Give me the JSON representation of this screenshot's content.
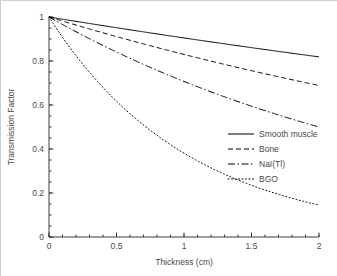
{
  "chart_data": {
    "type": "line",
    "title": "",
    "subtitle": "",
    "xlabel": "Thickness (cm)",
    "ylabel": "Transmission Factor",
    "xlim": [
      0,
      2
    ],
    "ylim": [
      0,
      1
    ],
    "grid": false,
    "legend_position": "center-right",
    "xticks": [
      0,
      0.5,
      1,
      1.5,
      2
    ],
    "xticklabels": [
      "0",
      "0.5",
      "1",
      "1.5",
      "2"
    ],
    "xminor_step": 0.1,
    "yticks": [
      0,
      0.2,
      0.4,
      0.6,
      0.8,
      1
    ],
    "yticklabels": [
      "0",
      "0.2",
      "0.4",
      "0.6",
      "0.8",
      "1"
    ],
    "yminor_step": 0.05,
    "x": [
      0,
      0.1,
      0.2,
      0.3,
      0.4,
      0.5,
      0.6,
      0.7,
      0.8,
      0.9,
      1.0,
      1.1,
      1.2,
      1.3,
      1.4,
      1.5,
      1.6,
      1.7,
      1.8,
      1.9,
      2.0
    ],
    "series": [
      {
        "name": "Smooth muscle",
        "linestyle": "solid",
        "color": "#000000",
        "mu": 0.1,
        "values": [
          1.0,
          0.99,
          0.98,
          0.97,
          0.961,
          0.951,
          0.942,
          0.932,
          0.923,
          0.914,
          0.905,
          0.895,
          0.887,
          0.878,
          0.869,
          0.861,
          0.852,
          0.844,
          0.835,
          0.827,
          0.819
        ]
      },
      {
        "name": "Bone",
        "linestyle": "dashed",
        "color": "#000000",
        "mu": 0.1865,
        "values": [
          1.0,
          0.982,
          0.964,
          0.946,
          0.928,
          0.911,
          0.894,
          0.878,
          0.862,
          0.846,
          0.83,
          0.815,
          0.8,
          0.785,
          0.771,
          0.756,
          0.742,
          0.729,
          0.715,
          0.702,
          0.689
        ]
      },
      {
        "name": "NaI(Tl)",
        "linestyle": "dashdot",
        "color": "#000000",
        "mu": 0.3466,
        "values": [
          1.0,
          0.966,
          0.933,
          0.901,
          0.871,
          0.841,
          0.812,
          0.784,
          0.758,
          0.732,
          0.707,
          0.683,
          0.66,
          0.637,
          0.615,
          0.594,
          0.574,
          0.555,
          0.536,
          0.517,
          0.5
        ]
      },
      {
        "name": "BGO",
        "linestyle": "dotted",
        "color": "#000000",
        "mu": 0.9651,
        "values": [
          1.0,
          0.908,
          0.824,
          0.748,
          0.679,
          0.617,
          0.56,
          0.508,
          0.462,
          0.419,
          0.381,
          0.346,
          0.314,
          0.285,
          0.259,
          0.235,
          0.213,
          0.194,
          0.176,
          0.16,
          0.145
        ]
      }
    ]
  }
}
